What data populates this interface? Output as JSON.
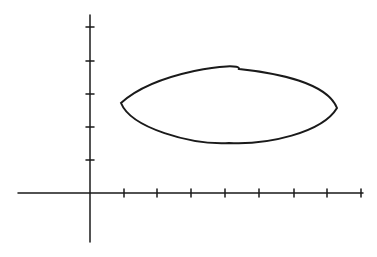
{
  "diagram": {
    "stroke_color": "#1a1a1a",
    "background": "#ffffff",
    "x_axis": {
      "y": 193,
      "x_start": 18,
      "x_end": 363,
      "tick_count": 8,
      "ticks_x": [
        124,
        157,
        191,
        225,
        259,
        294,
        327,
        361
      ]
    },
    "y_axis": {
      "x": 90,
      "y_start": 15,
      "y_end": 242,
      "tick_count": 5,
      "ticks_y": [
        27,
        61,
        94,
        127,
        160
      ]
    },
    "shape": {
      "type": "lens",
      "left_tip": [
        121,
        103
      ],
      "right_tip": [
        337,
        108
      ],
      "top_y": 69,
      "bottom_y": 143
    }
  }
}
